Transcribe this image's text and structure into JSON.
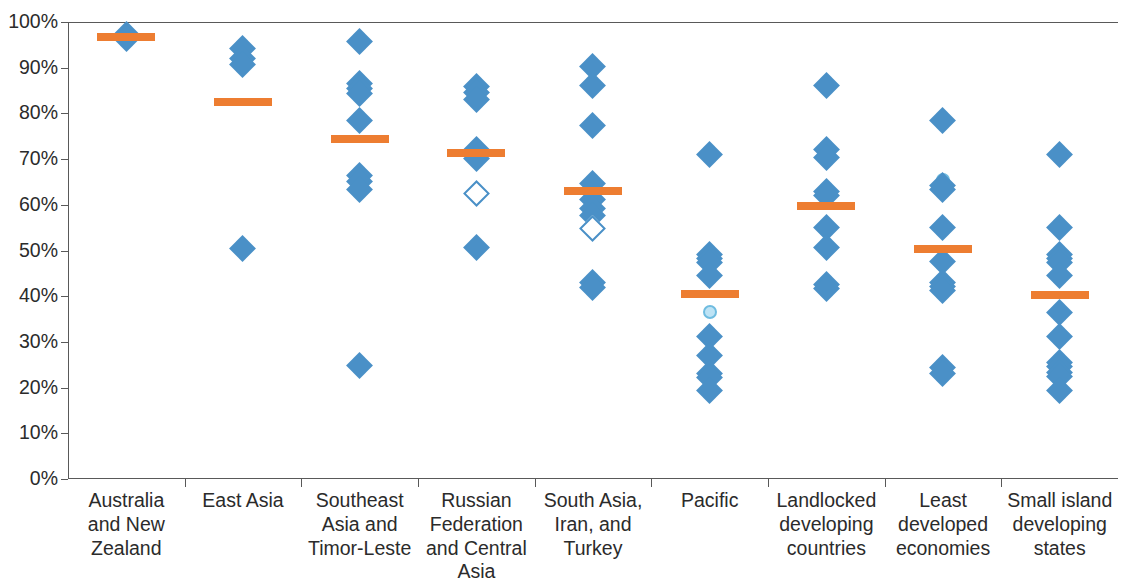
{
  "chart_data": {
    "type": "scatter",
    "title": "",
    "xlabel": "",
    "ylabel": "",
    "ylim": [
      0,
      100
    ],
    "y_unit": "%",
    "grid": false,
    "legend": "none",
    "y_ticks": [
      "0%",
      "10%",
      "20%",
      "30%",
      "40%",
      "50%",
      "60%",
      "70%",
      "80%",
      "90%",
      "100%"
    ],
    "y_tick_values": [
      0,
      10,
      20,
      30,
      40,
      50,
      60,
      70,
      80,
      90,
      100
    ],
    "categories": [
      "Australia and New Zealand",
      "East Asia",
      "Southeast Asia and Timor-Leste",
      "Russian Federation and Central Asia",
      "South Asia, Iran, and Turkey",
      "Pacific",
      "Landlocked developing countries",
      "Least developed economies",
      "Small island developing states"
    ],
    "category_lines": [
      [
        "Australia",
        "and New",
        "Zealand"
      ],
      [
        "East Asia"
      ],
      [
        "Southeast",
        "Asia and",
        "Timor-Leste"
      ],
      [
        "Russian",
        "Federation",
        "and Central",
        "Asia"
      ],
      [
        "South Asia,",
        "Iran, and",
        "Turkey"
      ],
      [
        "Pacific"
      ],
      [
        "Landlocked",
        "developing",
        "countries"
      ],
      [
        "Least",
        "developed",
        "economies"
      ],
      [
        "Small island",
        "developing",
        "states"
      ]
    ],
    "marker_colors": {
      "diamond_fill": "#4A90C7",
      "diamond_hollow_stroke": "#4A90C7",
      "circle_fill": "#BDE3F5",
      "circle_stroke": "#6FBCE0",
      "mean_bar": "#ED7D31",
      "axis": "#595959",
      "text": "#2b2b2b"
    },
    "series": [
      {
        "name": "Australia and New Zealand",
        "mean": 96.8,
        "points": [
          {
            "value": 97.2,
            "marker": "diamond"
          },
          {
            "value": 96.4,
            "marker": "diamond"
          }
        ]
      },
      {
        "name": "East Asia",
        "mean": 82.5,
        "points": [
          {
            "value": 94.3,
            "marker": "diamond"
          },
          {
            "value": 92.1,
            "marker": "diamond"
          },
          {
            "value": 90.6,
            "marker": "diamond"
          },
          {
            "value": 50.5,
            "marker": "diamond"
          }
        ]
      },
      {
        "name": "Southeast Asia and Timor-Leste",
        "mean": 74.5,
        "points": [
          {
            "value": 95.7,
            "marker": "diamond"
          },
          {
            "value": 86.6,
            "marker": "diamond"
          },
          {
            "value": 85.4,
            "marker": "diamond"
          },
          {
            "value": 84.3,
            "marker": "diamond"
          },
          {
            "value": 78.5,
            "marker": "diamond"
          },
          {
            "value": 66.5,
            "marker": "diamond"
          },
          {
            "value": 65.0,
            "marker": "diamond"
          },
          {
            "value": 63.4,
            "marker": "diamond"
          },
          {
            "value": 24.8,
            "marker": "diamond"
          }
        ]
      },
      {
        "name": "Russian Federation and Central Asia",
        "mean": 71.3,
        "points": [
          {
            "value": 85.9,
            "marker": "diamond"
          },
          {
            "value": 84.5,
            "marker": "diamond"
          },
          {
            "value": 83.1,
            "marker": "diamond"
          },
          {
            "value": 72.1,
            "marker": "diamond"
          },
          {
            "value": 70.2,
            "marker": "diamond"
          },
          {
            "value": 62.5,
            "marker": "diamond-hollow"
          },
          {
            "value": 50.6,
            "marker": "diamond"
          }
        ]
      },
      {
        "name": "South Asia, Iran, and Turkey",
        "mean": 63.1,
        "points": [
          {
            "value": 90.3,
            "marker": "diamond"
          },
          {
            "value": 86.0,
            "marker": "diamond"
          },
          {
            "value": 77.3,
            "marker": "diamond"
          },
          {
            "value": 64.6,
            "marker": "diamond"
          },
          {
            "value": 61.1,
            "marker": "diamond"
          },
          {
            "value": 59.2,
            "marker": "diamond"
          },
          {
            "value": 57.6,
            "marker": "diamond"
          },
          {
            "value": 54.8,
            "marker": "diamond-hollow"
          },
          {
            "value": 43.1,
            "marker": "diamond"
          },
          {
            "value": 42.0,
            "marker": "diamond"
          }
        ]
      },
      {
        "name": "Pacific",
        "mean": 40.5,
        "points": [
          {
            "value": 71.0,
            "marker": "diamond"
          },
          {
            "value": 49.2,
            "marker": "diamond"
          },
          {
            "value": 48.3,
            "marker": "diamond"
          },
          {
            "value": 47.4,
            "marker": "diamond"
          },
          {
            "value": 44.5,
            "marker": "diamond"
          },
          {
            "value": 36.6,
            "marker": "circle"
          },
          {
            "value": 31.1,
            "marker": "diamond"
          },
          {
            "value": 27.0,
            "marker": "diamond"
          },
          {
            "value": 23.1,
            "marker": "diamond"
          },
          {
            "value": 22.2,
            "marker": "diamond"
          },
          {
            "value": 19.3,
            "marker": "diamond"
          }
        ]
      },
      {
        "name": "Landlocked developing countries",
        "mean": 59.8,
        "points": [
          {
            "value": 86.0,
            "marker": "diamond"
          },
          {
            "value": 72.1,
            "marker": "diamond"
          },
          {
            "value": 70.4,
            "marker": "diamond"
          },
          {
            "value": 63.0,
            "marker": "diamond"
          },
          {
            "value": 62.0,
            "marker": "diamond"
          },
          {
            "value": 55.0,
            "marker": "diamond"
          },
          {
            "value": 50.6,
            "marker": "diamond"
          },
          {
            "value": 42.6,
            "marker": "diamond"
          },
          {
            "value": 41.7,
            "marker": "diamond"
          }
        ]
      },
      {
        "name": "Least developed economies",
        "mean": 50.3,
        "points": [
          {
            "value": 78.5,
            "marker": "diamond"
          },
          {
            "value": 65.5,
            "marker": "circle"
          },
          {
            "value": 64.2,
            "marker": "diamond"
          },
          {
            "value": 63.3,
            "marker": "diamond"
          },
          {
            "value": 55.0,
            "marker": "diamond"
          },
          {
            "value": 47.5,
            "marker": "diamond"
          },
          {
            "value": 43.1,
            "marker": "diamond"
          },
          {
            "value": 42.2,
            "marker": "diamond"
          },
          {
            "value": 41.3,
            "marker": "diamond"
          },
          {
            "value": 24.5,
            "marker": "diamond"
          },
          {
            "value": 23.0,
            "marker": "diamond"
          }
        ]
      },
      {
        "name": "Small island developing states",
        "mean": 40.2,
        "points": [
          {
            "value": 71.0,
            "marker": "diamond"
          },
          {
            "value": 55.0,
            "marker": "diamond"
          },
          {
            "value": 49.2,
            "marker": "diamond"
          },
          {
            "value": 48.3,
            "marker": "diamond"
          },
          {
            "value": 47.3,
            "marker": "diamond"
          },
          {
            "value": 44.5,
            "marker": "diamond"
          },
          {
            "value": 36.5,
            "marker": "diamond"
          },
          {
            "value": 31.2,
            "marker": "diamond"
          },
          {
            "value": 25.6,
            "marker": "diamond"
          },
          {
            "value": 24.6,
            "marker": "diamond"
          },
          {
            "value": 23.4,
            "marker": "diamond"
          },
          {
            "value": 22.4,
            "marker": "diamond"
          },
          {
            "value": 19.3,
            "marker": "diamond"
          }
        ]
      }
    ]
  }
}
